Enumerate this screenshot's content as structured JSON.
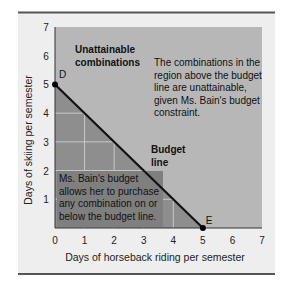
{
  "chart_data": {
    "type": "line",
    "title": "",
    "xlabel": "Days of horseback riding per semester",
    "ylabel": "Days of skiing per semester",
    "xlim": [
      0,
      7
    ],
    "ylim": [
      0,
      7
    ],
    "x_ticks": [
      "0",
      "1",
      "2",
      "3",
      "4",
      "5",
      "6",
      "7"
    ],
    "y_ticks": [
      "1",
      "2",
      "3",
      "4",
      "5",
      "6",
      "7"
    ],
    "grid": "inside attainable region only (at 1-4 on each axis)",
    "series": [
      {
        "name": "Budget line",
        "x": [
          0,
          5
        ],
        "y": [
          5,
          0
        ]
      }
    ],
    "points": [
      {
        "label": "D",
        "x": 0,
        "y": 5
      },
      {
        "label": "E",
        "x": 5,
        "y": 0
      }
    ],
    "regions": [
      {
        "name": "Unattainable combinations",
        "description": "area above the budget line",
        "color": "#b7b7b7"
      },
      {
        "name": "Attainable combinations",
        "description": "area on or below the budget line",
        "color": "#8e8e8e"
      }
    ],
    "annotations": [
      {
        "text": "Unattainable combinations",
        "bold": true
      },
      {
        "text": "The combinations in the region above the budget line are unattainable, given Ms. Bain's budget constraint.",
        "bold": false
      },
      {
        "text": "Budget line",
        "bold": true
      },
      {
        "text": "Ms. Bain's budget allows her to purchase any combination on or below the budget line.",
        "bold": false
      }
    ]
  },
  "labels": {
    "unattainable_l1": "Unattainable",
    "unattainable_l2": "combinations",
    "right_note": [
      "The combinations in the",
      "region above the budget",
      "line are unattainable,",
      "given Ms. Bain's budget",
      "constraint."
    ],
    "budget_l1": "Budget",
    "budget_l2": "line",
    "left_note": [
      "Ms. Bain's budget",
      "allows her to purchase",
      "any combination on or",
      "below the budget line."
    ],
    "point_d": "D",
    "point_e": "E"
  },
  "colors": {
    "panel": "#eeeeee",
    "unattainable": "#b7b7b7",
    "attainable": "#8e8e8e",
    "note_box": "#7f7f7f",
    "grid": "#c9c9c9",
    "line": "#111111",
    "rule": "#555555"
  }
}
